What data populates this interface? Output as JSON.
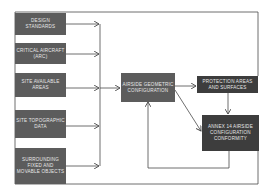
{
  "diagram": {
    "inputs": [
      {
        "label": "Design Standards"
      },
      {
        "label": "Critical Aircraft (ARC)"
      },
      {
        "label": "Site Available Areas"
      },
      {
        "label": "Site Topographic Data"
      },
      {
        "label": "Surrounding Fixed and Movable Objects"
      }
    ],
    "central": {
      "label": "Airside Geometric Configuration"
    },
    "protection": {
      "label": "Protection Areas and Surfaces"
    },
    "annex": {
      "label": "Annex 14 Airside Configuration Conformity"
    },
    "colors": {
      "input_box": "#5c5c5c",
      "output_box": "#3d3d3d",
      "line": "#4a4a4a",
      "text": "#e8e8e8"
    }
  }
}
